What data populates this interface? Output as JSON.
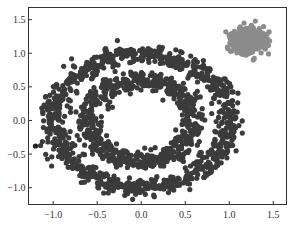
{
  "chart_data": {
    "type": "scatter",
    "title": "",
    "xlabel": "",
    "ylabel": "",
    "xlim": [
      -1.28,
      1.65
    ],
    "ylim": [
      -1.25,
      1.68
    ],
    "grid": false,
    "legend": null,
    "x_ticks": [
      -1.0,
      -0.5,
      0.0,
      0.5,
      1.0,
      1.5
    ],
    "x_tick_labels": [
      "−1.0",
      "−0.5",
      "0.0",
      "0.5",
      "1.0",
      "1.5"
    ],
    "y_ticks": [
      -1.0,
      -0.5,
      0.0,
      0.5,
      1.0,
      1.5
    ],
    "y_tick_labels": [
      "−1.0",
      "−0.5",
      "0.0",
      "0.5",
      "1.0",
      "1.5"
    ],
    "series": [
      {
        "name": "outer-ring",
        "shape": "ring",
        "color": "#3b3b3b",
        "center": [
          0.0,
          0.0
        ],
        "radius": 1.0,
        "noise": 0.07,
        "n_points": 900
      },
      {
        "name": "inner-ring",
        "shape": "ring",
        "color": "#3b3b3b",
        "center": [
          0.0,
          0.0
        ],
        "radius": 0.6,
        "noise": 0.07,
        "n_points": 650
      },
      {
        "name": "blob",
        "shape": "gaussian",
        "color": "#8c8c8c",
        "center": [
          1.22,
          1.19
        ],
        "std": 0.09,
        "n_points": 450
      },
      {
        "name": "outliers",
        "shape": "points",
        "color": "#1e1e1e",
        "points": [
          [
            -1.2,
            -0.38
          ]
        ]
      }
    ],
    "marker_radius_px": 2.6
  }
}
